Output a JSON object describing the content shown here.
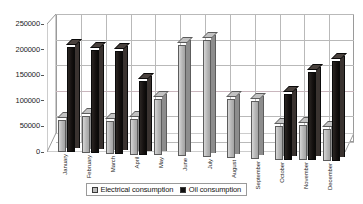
{
  "chart_data": {
    "type": "bar",
    "title": "",
    "subtitle": "",
    "xlabel": "",
    "ylabel": "",
    "ylim": [
      0,
      250000
    ],
    "yticks": [
      0,
      50000,
      100000,
      150000,
      200000,
      250000
    ],
    "ytick_labels": [
      "0",
      "50000",
      "100000",
      "150000",
      "200000",
      "250000"
    ],
    "grid": true,
    "legend_position": "bottom",
    "style": "3d-column",
    "categories": [
      "January",
      "February",
      "March",
      "April",
      "May",
      "June",
      "July",
      "August",
      "September",
      "October",
      "November",
      "December"
    ],
    "series": [
      {
        "name": "Electrical consumption",
        "color": "#bdbdbd",
        "values": [
          62000,
          72000,
          63000,
          70000,
          110000,
          218000,
          228000,
          115000,
          113000,
          65000,
          70000,
          62000
        ]
      },
      {
        "name": "Oil consumption",
        "color": "#111111",
        "values": [
          205000,
          200000,
          200000,
          143000,
          0,
          0,
          0,
          0,
          0,
          128000,
          172000,
          195000
        ]
      }
    ]
  },
  "legend": {
    "items": [
      {
        "label": "Electrical consumption",
        "swatch": "legend-swatch-electrical"
      },
      {
        "label": "Oil consumption",
        "swatch": "legend-swatch-oil"
      }
    ]
  }
}
